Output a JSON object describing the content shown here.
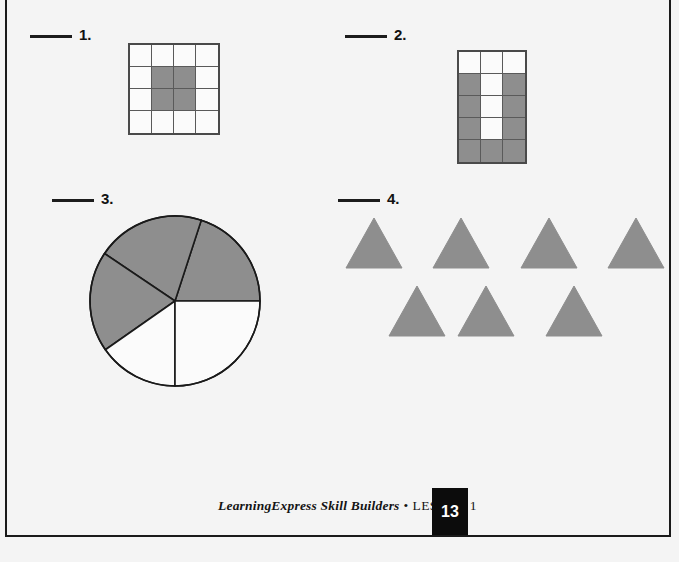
{
  "page": {
    "background_color": "#f4f4f4",
    "shade_color": "#8e8e8e",
    "line_color": "#1a1a1a",
    "width": 679,
    "height": 562
  },
  "problems": [
    {
      "number": "1.",
      "answer_blank": "",
      "figure": "grid",
      "grid": {
        "columns": 4,
        "rows": 4,
        "total_cells": 16,
        "shaded_cells": 4,
        "shaded_indices": [
          5,
          6,
          9,
          10
        ],
        "cells": [
          false,
          false,
          false,
          false,
          false,
          true,
          true,
          false,
          false,
          true,
          true,
          false,
          false,
          false,
          false,
          false
        ]
      }
    },
    {
      "number": "2.",
      "answer_blank": "",
      "figure": "grid",
      "grid": {
        "columns": 3,
        "rows": 5,
        "total_cells": 15,
        "shaded_cells": 9,
        "shaded_indices": [
          3,
          5,
          6,
          8,
          9,
          11,
          12,
          13,
          14
        ],
        "cells": [
          false,
          false,
          false,
          true,
          false,
          true,
          true,
          false,
          true,
          true,
          false,
          true,
          true,
          true,
          true
        ]
      }
    },
    {
      "number": "3.",
      "answer_blank": "",
      "figure": "pie",
      "pie": {
        "total_sectors": 5,
        "shaded_sectors": 3,
        "center_x": 175,
        "center_y": 301,
        "radius": 85,
        "sectors": [
          {
            "start_deg": 0,
            "end_deg": 72,
            "shaded": true
          },
          {
            "start_deg": 72,
            "end_deg": 146,
            "shaded": true
          },
          {
            "start_deg": 146,
            "end_deg": 215,
            "shaded": true
          },
          {
            "start_deg": 215,
            "end_deg": 270,
            "shaded": false
          },
          {
            "start_deg": 270,
            "end_deg": 360,
            "shaded": false
          }
        ]
      }
    },
    {
      "number": "4.",
      "answer_blank": "",
      "figure": "triangles",
      "triangles": {
        "total": 7,
        "shaded": 7,
        "rows": [
          {
            "count": 4,
            "shaded": [
              true,
              true,
              true,
              true
            ]
          },
          {
            "count": 3,
            "shaded": [
              true,
              true,
              true
            ]
          }
        ]
      }
    }
  ],
  "footer": {
    "brand": "LearningExpress Skill Builders",
    "separator": "•",
    "lesson": "LESSON 1",
    "page_number": "13"
  }
}
